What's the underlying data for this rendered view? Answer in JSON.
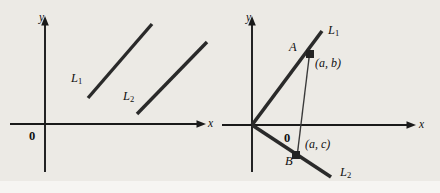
{
  "figure": {
    "background_color": "#eceae5",
    "ink_color": "#1a1a1a",
    "width": 440,
    "height": 193,
    "panels": [
      {
        "id": "left-panel",
        "name": "parallel-lines-diagram",
        "axes": {
          "x_label": "x",
          "y_label": "y",
          "origin_label": "0",
          "origin": {
            "x": 45,
            "y": 124
          },
          "x_axis": {
            "x1": 10,
            "y1": 124,
            "x2": 206,
            "y2": 124
          },
          "y_axis": {
            "x1": 45,
            "y1": 172,
            "x2": 45,
            "y2": 18
          }
        },
        "lines": [
          {
            "label": "L",
            "subscript": "1",
            "x1": 88,
            "y1": 98,
            "x2": 152,
            "y2": 24,
            "label_x": 71,
            "label_y": 72
          },
          {
            "label": "L",
            "subscript": "2",
            "x1": 137,
            "y1": 114,
            "x2": 207,
            "y2": 42,
            "label_x": 123,
            "label_y": 90
          }
        ]
      },
      {
        "id": "right-panel",
        "name": "perpendicular-lines-diagram",
        "axes": {
          "x_label": "x",
          "y_label": "y",
          "origin_label": "0",
          "origin": {
            "x": 252,
            "y": 125
          },
          "x_axis": {
            "x1": 222,
            "y1": 125,
            "x2": 416,
            "y2": 125
          },
          "y_axis": {
            "x1": 252,
            "y1": 172,
            "x2": 252,
            "y2": 18
          }
        },
        "lines": [
          {
            "label": "L",
            "subscript": "1",
            "x1": 252,
            "y1": 125,
            "x2": 322,
            "y2": 32,
            "label_x": 328,
            "label_y": 26
          },
          {
            "label": "L",
            "subscript": "2",
            "x1": 252,
            "y1": 125,
            "x2": 332,
            "y2": 178,
            "label_x": 340,
            "label_y": 166
          }
        ],
        "points": [
          {
            "name": "A",
            "label": "A",
            "coord_label": "(a, b)",
            "x": 310,
            "y": 54,
            "label_x": 291,
            "label_y": 42,
            "coord_x": 315,
            "coord_y": 56
          },
          {
            "name": "B",
            "label": "B",
            "coord_label": "(a, c)",
            "x": 296,
            "y": 155,
            "label_x": 286,
            "label_y": 155,
            "coord_x": 306,
            "coord_y": 138
          }
        ],
        "drop_line": {
          "x1": 310,
          "y1": 54,
          "x2": 296,
          "y2": 155
        }
      }
    ]
  }
}
